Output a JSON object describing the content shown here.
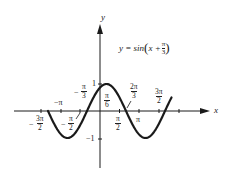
{
  "figure": {
    "equation_prefix": "y = sin",
    "equation_x": "x + ",
    "equation_num": "π",
    "equation_den": "3",
    "x_axis_label": "x",
    "y_axis_label": "y",
    "y_tick_pos": "1",
    "y_tick_neg": "−1",
    "tick_labels": {
      "neg_pi": "−π",
      "neg_3pi_2": {
        "sign": "−",
        "num": "3π",
        "den": "2"
      },
      "neg_pi_2": {
        "sign": "−",
        "num": "π",
        "den": "2"
      },
      "neg_pi_3": {
        "sign": "−",
        "num": "π",
        "den": "3"
      },
      "pi_6": {
        "num": "π",
        "den": "6"
      },
      "pi_2": {
        "num": "π",
        "den": "2"
      },
      "two_pi_3": {
        "num": "2π",
        "den": "3"
      },
      "pi": "π",
      "three_pi_2": {
        "num": "3π",
        "den": "2"
      }
    },
    "colors": {
      "curve": "#1a1a1a",
      "axes": "#1a1a1a",
      "background": "#ffffff"
    }
  },
  "chart_data": {
    "type": "line",
    "xlabel": "x",
    "ylabel": "y",
    "function": "sin(x + pi/3)",
    "xlim": [
      -4.19,
      5.76
    ],
    "ylim": [
      -1,
      1
    ],
    "x_ticks": [
      "-3π/2",
      "-π",
      "-π/2",
      "π/2",
      "π",
      "3π/2",
      "2π"
    ],
    "y_ticks": [
      "-1",
      "1"
    ],
    "annotations": [
      {
        "label": "-π/3",
        "x": -1.047,
        "y": 0,
        "note": "zero crossing"
      },
      {
        "label": "π/6",
        "x": 0.524,
        "y": 1,
        "note": "maximum"
      },
      {
        "label": "2π/3",
        "x": 2.094,
        "y": 0,
        "note": "zero crossing"
      }
    ],
    "series": [
      {
        "name": "sin(x + π/3)",
        "x": [
          -4.19,
          -3.67,
          -3.14,
          -2.62,
          -2.09,
          -1.57,
          -1.05,
          -0.52,
          0,
          0.52,
          1.05,
          1.57,
          2.09,
          2.62,
          3.14,
          3.67,
          4.19,
          4.71,
          5.24,
          5.76
        ],
        "values": [
          0,
          -0.5,
          -0.87,
          -1,
          -0.87,
          -0.5,
          0,
          0.5,
          0.87,
          1,
          0.87,
          0.5,
          0,
          -0.5,
          -0.87,
          -1,
          -0.87,
          -0.5,
          0,
          0.5
        ]
      }
    ],
    "grid": false,
    "legend": "none"
  }
}
